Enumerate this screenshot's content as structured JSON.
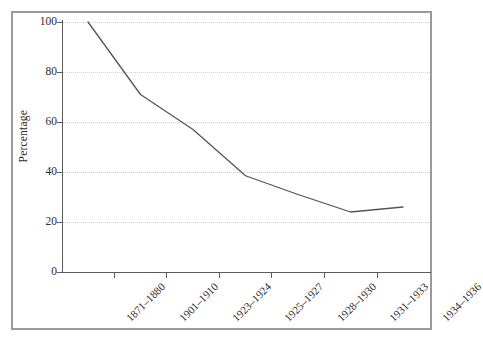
{
  "chart_data": {
    "type": "line",
    "title": "",
    "subtitle": "",
    "xlabel": "",
    "ylabel": "Percentage",
    "categories": [
      "1871–1880",
      "1901–1910",
      "1923–1924",
      "1925–1927",
      "1928–1930",
      "1931–1933",
      "1934–1936"
    ],
    "values": [
      100,
      71,
      57,
      38.5,
      31,
      24,
      26
    ],
    "series": [
      {
        "name": "Percentage",
        "values": [
          100,
          71,
          57,
          38.5,
          31,
          24,
          26
        ]
      }
    ],
    "ylim": [
      0,
      100
    ],
    "yticks": [
      0,
      20,
      40,
      60,
      80,
      100
    ],
    "ytick_labels": [
      "0",
      "20",
      "40",
      "60",
      "80",
      "100"
    ],
    "grid": "horizontal-dotted",
    "legend": "none",
    "line_color": "#555555",
    "grid_color": "#d2d2d2",
    "axis_color": "#5a5a5a",
    "frame_color": "#9a9a9a",
    "background": "#ffffff",
    "annotations": []
  }
}
